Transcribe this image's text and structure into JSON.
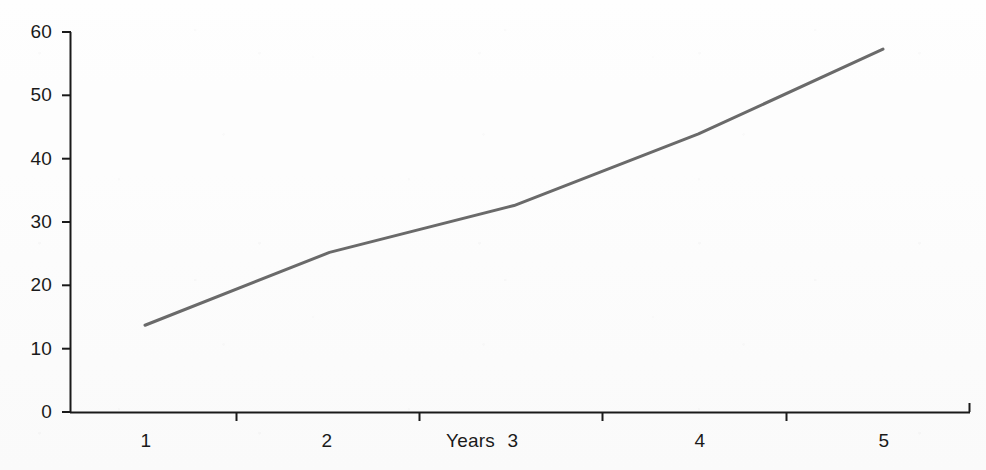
{
  "chart_data": {
    "type": "line",
    "title": "",
    "subtitle": "",
    "xlabel": "Years",
    "ylabel": "",
    "x": [
      1,
      2,
      3,
      4,
      5
    ],
    "categories": [
      "1",
      "2",
      "3",
      "4",
      "5"
    ],
    "values": [
      13.7,
      25.2,
      32.6,
      43.9,
      57.3
    ],
    "series": [
      {
        "name": "",
        "values": [
          13.7,
          25.2,
          32.6,
          43.9,
          57.3
        ],
        "color": "#6a6a6a"
      }
    ],
    "xlim": [
      0.5,
      5.5
    ],
    "ylim": [
      0,
      60
    ],
    "y_ticks": [
      0,
      10,
      20,
      30,
      40,
      50,
      60
    ],
    "y_tick_labels": [
      "0",
      "10",
      "20",
      "30",
      "40",
      "50",
      "60"
    ],
    "x_ticks": [
      1,
      2,
      3,
      4,
      5
    ],
    "x_tick_labels": [
      "1",
      "2",
      "3",
      "4",
      "5"
    ],
    "grid": false,
    "legend": false,
    "legend_position": "none",
    "markers": false,
    "annotations": []
  },
  "axes": {
    "axis_color": "#1a1a1a",
    "line_color": "#6a6a6a",
    "background": "#fdfdfd",
    "y_label_texts": [
      "60",
      "50",
      "40",
      "30",
      "20",
      "10",
      "0"
    ],
    "x_label_texts": [
      "1",
      "2",
      "3",
      "4",
      "5"
    ],
    "x_axis_title": "Years"
  }
}
